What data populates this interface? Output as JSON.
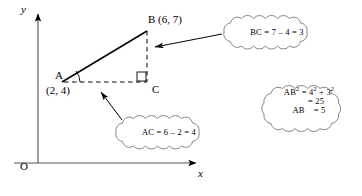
{
  "figure": {
    "background_color": "#ffffff",
    "ink_color": "#000000"
  },
  "axes": {
    "y_label": "y",
    "x_label": "x",
    "origin_label": "O"
  },
  "points": [
    {
      "name": "A",
      "label": "A",
      "coord_label": "(2, 4)"
    },
    {
      "name": "B",
      "label": "B (6, 7)",
      "coord_label": ""
    },
    {
      "name": "C",
      "label": "C",
      "coord_label": ""
    }
  ],
  "vertex_a": {
    "label": "A",
    "coords": "(2, 4)"
  },
  "vertex_b": {
    "label": "B (6, 7)"
  },
  "vertex_c": {
    "label": "C"
  },
  "callouts": {
    "bc": {
      "name": "bc-callout",
      "line1": "BC = 7 – 4 = 3"
    },
    "ac": {
      "name": "ac-callout",
      "line1": "AC = 6 – 2 = 4"
    },
    "ab": {
      "name": "ab-callout",
      "line1_pre": "AB",
      "line1_sup1": "2",
      "line1_mid": " = 4",
      "line1_sup2": "2",
      "line1_mid2": " + 3",
      "line1_sup3": "2",
      "line2": "= 25",
      "line3_pre": "AB",
      "line3_post": "= 5"
    }
  }
}
